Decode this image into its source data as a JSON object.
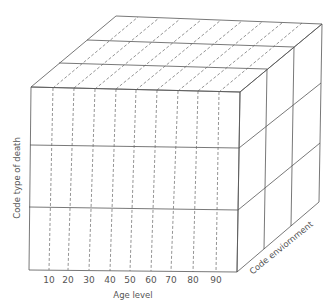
{
  "diagram": {
    "type": "3d-cube-classification",
    "axes": {
      "x": {
        "label": "Age level",
        "ticks": [
          "10",
          "20",
          "30",
          "40",
          "50",
          "60",
          "70",
          "80",
          "90"
        ]
      },
      "y": {
        "label": "Code type of death"
      },
      "z": {
        "label": "Code enviornment"
      }
    },
    "divisions": {
      "age_columns": 10,
      "death_type_rows": 3,
      "environment_layers": 3
    },
    "colors": {
      "line": "#555555",
      "background": "#ffffff"
    }
  }
}
